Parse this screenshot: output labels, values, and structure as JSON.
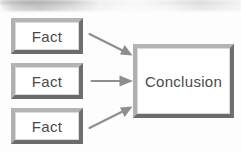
{
  "diagram": {
    "background_color": "#fdfdfd",
    "stroke_color": "#6f6f6f",
    "bevel_light_color": "#b4b4b4",
    "text_color": "#4a4a4a",
    "arrow_color": "#8a8a8a"
  },
  "nodes": {
    "facts": [
      {
        "id": "fact-1",
        "label": "Fact"
      },
      {
        "id": "fact-2",
        "label": "Fact"
      },
      {
        "id": "fact-3",
        "label": "Fact"
      }
    ],
    "conclusion": {
      "id": "conclusion",
      "label": "Conclusion"
    }
  },
  "arrows": [
    {
      "id": "arrow-top",
      "from": "fact-1",
      "to": "conclusion",
      "direction": "down-right"
    },
    {
      "id": "arrow-middle",
      "from": "fact-2",
      "to": "conclusion",
      "direction": "right"
    },
    {
      "id": "arrow-bottom",
      "from": "fact-3",
      "to": "conclusion",
      "direction": "up-right"
    }
  ]
}
